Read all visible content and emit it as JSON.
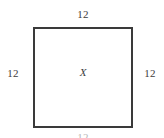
{
  "diagram": {
    "type": "square-with-side-labels",
    "shape_name": "square",
    "border_color": "#3a3a3a",
    "fill_color": "#ffffff",
    "background_color": "#ffffff",
    "text_color": "#3d3d3d",
    "interior_label": "X",
    "side_labels": {
      "top": "12",
      "left": "12",
      "right": "12",
      "bottom": "12"
    }
  }
}
